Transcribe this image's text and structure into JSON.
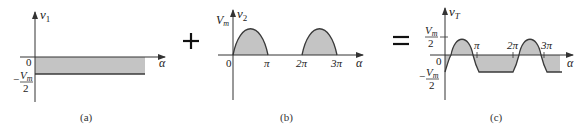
{
  "figure": {
    "operators": {
      "plus": "+",
      "equals": "="
    },
    "panel_a": {
      "caption": "(a)",
      "y_axis_label": "v",
      "y_axis_sub": "1",
      "x_axis_label": "α",
      "origin_label": "0",
      "level_label_num": "V",
      "level_label_num_sub": "m",
      "level_label_den": "2",
      "level_sign": "−",
      "description": "Constant level at −Vm/2 (shaded rectangle below axis)"
    },
    "panel_b": {
      "caption": "(b)",
      "y_axis_label": "v",
      "y_axis_sub": "2",
      "x_axis_label": "α",
      "peak_label": "V",
      "peak_label_sub": "m",
      "ticks": [
        "0",
        "π",
        "2π",
        "3π"
      ],
      "description": "Half-wave rectified sine: humps from 0 to π and 2π to 3π"
    },
    "panel_c": {
      "caption": "(c)",
      "y_axis_label": "v",
      "y_axis_sub": "T",
      "x_axis_label": "α",
      "origin_label": "0",
      "top_label_num": "V",
      "top_label_num_sub": "m",
      "top_label_den": "2",
      "bottom_sign": "−",
      "bottom_label_num": "V",
      "bottom_label_num_sub": "m",
      "bottom_label_den": "2",
      "ticks": [
        "π",
        "2π",
        "3π"
      ],
      "description": "Sum of (a) and (b): sine humps shifted down by Vm/2, flat at −Vm/2 between humps"
    },
    "colors": {
      "line": "#3a3a3a",
      "fill": "#c4c4c4",
      "axis": "#333333"
    }
  }
}
